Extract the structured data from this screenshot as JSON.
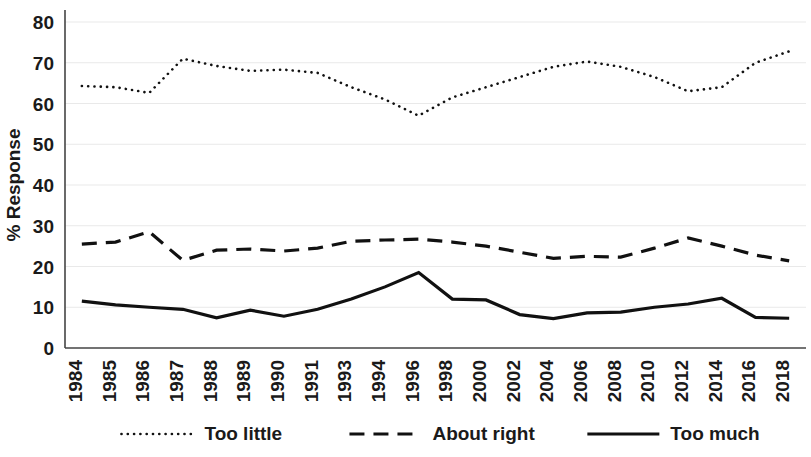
{
  "chart_data": {
    "type": "line",
    "title": "",
    "xlabel": "",
    "ylabel": "% Response",
    "ylim": [
      0,
      80
    ],
    "yticks": [
      0,
      10,
      20,
      30,
      40,
      50,
      60,
      70,
      80
    ],
    "grid": true,
    "legend_position": "bottom",
    "categories": [
      "1984",
      "1985",
      "1986",
      "1987",
      "1988",
      "1989",
      "1990",
      "1991",
      "1993",
      "1994",
      "1996",
      "1998",
      "2000",
      "2002",
      "2004",
      "2006",
      "2008",
      "2010",
      "2012",
      "2014",
      "2016",
      "2018"
    ],
    "series": [
      {
        "name": "Too little",
        "style": "dotted",
        "color": "#111111",
        "values": [
          64.3,
          64.0,
          62.6,
          71.0,
          69.2,
          68.0,
          68.3,
          67.5,
          64.0,
          61.0,
          57.0,
          61.5,
          64.0,
          66.5,
          69.0,
          70.3,
          69.0,
          66.5,
          63.0,
          64.0,
          70.0,
          72.8
        ]
      },
      {
        "name": "About right",
        "style": "dashed",
        "color": "#111111",
        "values": [
          25.5,
          26.0,
          28.5,
          21.5,
          24.0,
          24.3,
          23.8,
          24.5,
          26.2,
          26.5,
          26.7,
          26.0,
          25.0,
          23.5,
          22.0,
          22.5,
          22.3,
          24.5,
          27.0,
          25.0,
          22.8,
          21.4
        ]
      },
      {
        "name": "Too much",
        "style": "solid",
        "color": "#111111",
        "values": [
          11.5,
          10.6,
          10.0,
          9.5,
          7.4,
          9.3,
          7.8,
          9.5,
          12.0,
          15.0,
          18.5,
          12.0,
          11.8,
          8.2,
          7.2,
          8.6,
          8.8,
          10.0,
          10.8,
          12.2,
          7.5,
          7.3
        ]
      }
    ]
  },
  "legend": {
    "items": [
      {
        "label": "Too little",
        "style": "dotted"
      },
      {
        "label": "About right",
        "style": "dashed"
      },
      {
        "label": "Too much",
        "style": "solid"
      }
    ]
  }
}
